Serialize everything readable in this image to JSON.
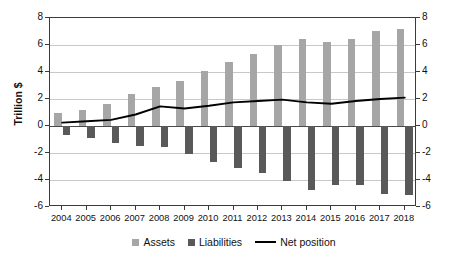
{
  "chart_data": {
    "type": "bar",
    "title": "",
    "xlabel": "",
    "ylabel": "Trillion $",
    "ylim": [
      -6,
      8
    ],
    "yticks": [
      8,
      6,
      4,
      2,
      0,
      -2,
      -4,
      -6
    ],
    "ytick_labels_left": [
      "8",
      "6",
      "4",
      "2",
      "0",
      "-2",
      "-4",
      "-6"
    ],
    "ytick_labels_right": [
      "8",
      "6",
      "4",
      "2",
      "0",
      "-2",
      "-4",
      "-6"
    ],
    "grid": true,
    "legend_position": "bottom",
    "categories": [
      "2004",
      "2005",
      "2006",
      "2007",
      "2008",
      "2009",
      "2010",
      "2011",
      "2012",
      "2013",
      "2014",
      "2015",
      "2016",
      "2017",
      "2018"
    ],
    "series": [
      {
        "name": "Assets",
        "type": "bar",
        "color": "#a6a6a6",
        "values": [
          0.95,
          1.2,
          1.65,
          2.35,
          2.9,
          3.35,
          4.1,
          4.75,
          5.3,
          6.0,
          6.45,
          6.2,
          6.45,
          7.05,
          7.2
        ]
      },
      {
        "name": "Liabilities",
        "type": "bar",
        "color": "#595959",
        "values": [
          -0.65,
          -0.9,
          -1.25,
          -1.5,
          -1.55,
          -2.1,
          -2.65,
          -3.1,
          -3.5,
          -4.05,
          -4.75,
          -4.35,
          -4.4,
          -5.0,
          -5.1
        ]
      },
      {
        "name": "Net position",
        "type": "line",
        "color": "#000000",
        "values": [
          0.25,
          0.35,
          0.45,
          0.85,
          1.45,
          1.3,
          1.5,
          1.75,
          1.85,
          1.95,
          1.75,
          1.65,
          1.85,
          2.0,
          2.1
        ]
      }
    ]
  },
  "axis": {
    "y_title": "Trillion $"
  },
  "legend": {
    "assets_label": "Assets",
    "liabilities_label": "Liabilities",
    "net_position_label": "Net position"
  }
}
